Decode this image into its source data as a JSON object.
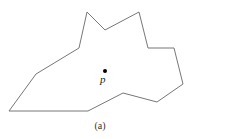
{
  "figure": {
    "caption": "(a)",
    "point_label": "p",
    "polygon_points": "87,12 105,30 139,12 148,48 174,48 183,84 157,102 123,93 88,111 9,111 36,74 79,48",
    "point": {
      "x": 105,
      "y": 71
    },
    "stroke_color": "#777777"
  }
}
